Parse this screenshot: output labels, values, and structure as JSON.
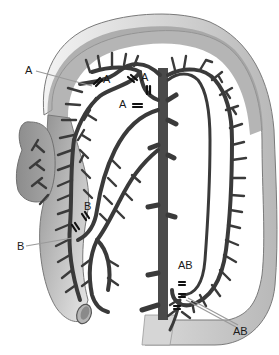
{
  "diagram": {
    "type": "anatomical-illustration",
    "colors": {
      "bowel_dark": "#8a8a8a",
      "bowel_light": "#e6e6e6",
      "vessel": "#3a3a3a",
      "aorta": "#4a4a4a",
      "leader_line": "#9a9a9a",
      "label": "#1a1a1a"
    },
    "labels": {
      "a_outer": "A",
      "a_upper_left": "A",
      "a_upper_right": "A",
      "a_middle": "A",
      "b_inner": "B",
      "b_outer": "B",
      "ab_inner": "AB",
      "ab_outer": "AB"
    }
  }
}
